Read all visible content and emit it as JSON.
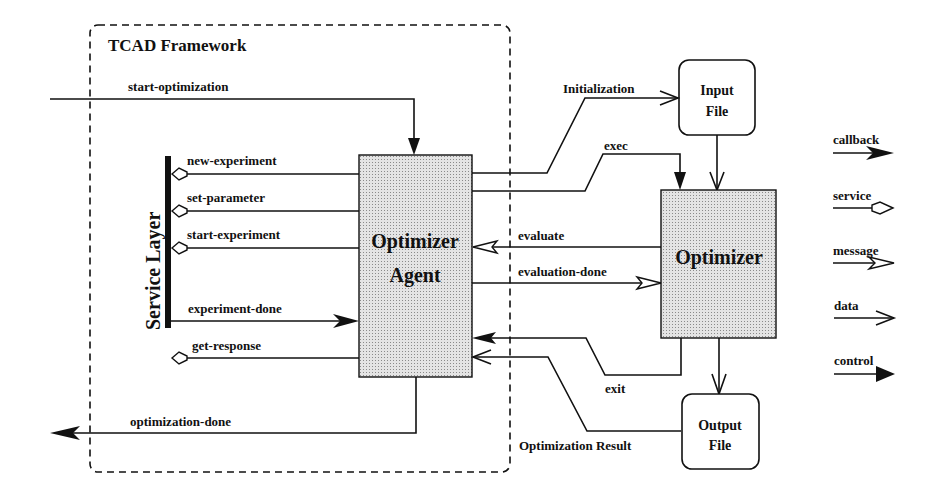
{
  "framework": {
    "title": "TCAD Framework"
  },
  "service_layer": {
    "label": "Service Layer"
  },
  "optimizer_agent": {
    "line1": "Optimizer",
    "line2": "Agent"
  },
  "optimizer": {
    "label": "Optimizer"
  },
  "input_file": {
    "line1": "Input",
    "line2": "File"
  },
  "output_file": {
    "line1": "Output",
    "line2": "File"
  },
  "arrows": {
    "start_optimization": "start-optimization",
    "new_experiment": "new-experiment",
    "set_parameter": "set-parameter",
    "start_experiment": "start-experiment",
    "experiment_done": "experiment-done",
    "get_response": "get-response",
    "optimization_done": "optimization-done",
    "initialization": "Initialization",
    "exec": "exec",
    "evaluate": "evaluate",
    "evaluation_done": "evaluation-done",
    "exit": "exit",
    "optimization_result": "Optimization Result"
  },
  "legend": [
    {
      "label": "callback",
      "type": "filled-barb"
    },
    {
      "label": "service",
      "type": "hollow-diamond"
    },
    {
      "label": "message",
      "type": "hollow-barb"
    },
    {
      "label": "data",
      "type": "open-chevron"
    },
    {
      "label": "control",
      "type": "filled-triangle"
    }
  ]
}
